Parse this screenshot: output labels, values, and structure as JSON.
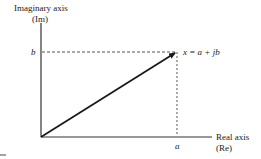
{
  "diagram": {
    "type": "complex-plane",
    "y_axis": {
      "label_line1": "Imaginary axis",
      "label_line2": "(Im)"
    },
    "x_axis": {
      "label_line1": "Real axis",
      "label_line2": "(Re)"
    },
    "point": {
      "label": "x = a + jb",
      "x_label": "a",
      "y_label": "b"
    },
    "colors": {
      "axis": "#333333",
      "vector": "#1a1a1a",
      "dashed": "#555555"
    }
  }
}
